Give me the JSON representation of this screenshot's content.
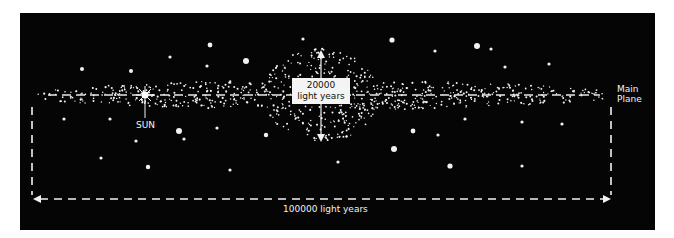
{
  "diagram": {
    "colors": {
      "background": "#050505",
      "stars": "#f2f2f2",
      "page": "#ffffff",
      "label_box": "#f4f4f4"
    },
    "labels": {
      "thickness_line1": "20000",
      "thickness_line2": "light years",
      "diameter": "100000 light years",
      "sun": "SUN",
      "main_plane_line1": "Main",
      "main_plane_line2": "Plane"
    },
    "disk": {
      "left_x": 38,
      "right_x": 605,
      "center_y": 95,
      "half_thickness": 12
    },
    "bulge": {
      "center_x": 321,
      "center_y": 95,
      "half_width": 58,
      "half_height": 47
    },
    "sun_position": [
      145,
      95
    ],
    "stars": [
      [
        82,
        69,
        2
      ],
      [
        131,
        71,
        2
      ],
      [
        170,
        57,
        1.6
      ],
      [
        210,
        45,
        2.4
      ],
      [
        207,
        66,
        1.6
      ],
      [
        246,
        61,
        3
      ],
      [
        303,
        39,
        1.6
      ],
      [
        392,
        40,
        2.6
      ],
      [
        435,
        51,
        1.6
      ],
      [
        477,
        46,
        3
      ],
      [
        491,
        49,
        1.6
      ],
      [
        505,
        67,
        1.6
      ],
      [
        549,
        64,
        1.6
      ],
      [
        64,
        119,
        1.6
      ],
      [
        110,
        119,
        1.6
      ],
      [
        179,
        131,
        3
      ],
      [
        136,
        141,
        1.6
      ],
      [
        184,
        139,
        1.6
      ],
      [
        217,
        128,
        1.6
      ],
      [
        266,
        135,
        2.2
      ],
      [
        465,
        119,
        1.6
      ],
      [
        522,
        122,
        1.6
      ],
      [
        562,
        124,
        1.6
      ],
      [
        413,
        131,
        2.4
      ],
      [
        438,
        135,
        1.6
      ],
      [
        394,
        149,
        3
      ],
      [
        338,
        162,
        1.6
      ],
      [
        450,
        166,
        2.6
      ],
      [
        522,
        166,
        1.6
      ],
      [
        101,
        158,
        1.6
      ],
      [
        148,
        167,
        2.2
      ],
      [
        230,
        170,
        1.6
      ]
    ]
  }
}
